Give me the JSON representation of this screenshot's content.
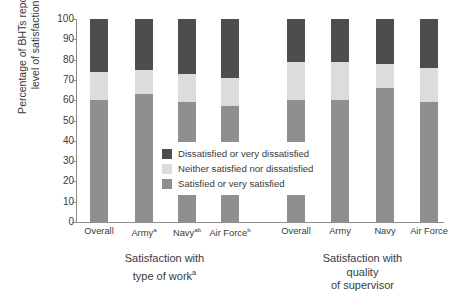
{
  "chart_data": {
    "type": "bar",
    "title": "",
    "subtitle": "",
    "stacked": true,
    "orientation": "vertical",
    "ylabel": "Percentage of BHTs reporting\nlevel of satisfaction",
    "xlabel": "",
    "ylim": [
      0,
      100
    ],
    "ytick_labels": [
      "0",
      "10",
      "20",
      "30",
      "40",
      "50",
      "60",
      "70",
      "80",
      "90",
      "100"
    ],
    "ytick_values": [
      0,
      10,
      20,
      30,
      40,
      50,
      60,
      70,
      80,
      90,
      100
    ],
    "grid": false,
    "legend_position": "center",
    "legend": [
      {
        "label": "Dissatisfied or very dissatisfied",
        "color": "#4d4d4d",
        "key": "dissatisfied"
      },
      {
        "label": "Neither satisfied nor dissatisfied",
        "color": "#dcdcdc",
        "key": "neutral"
      },
      {
        "label": "Satisfied or very satisfied",
        "color": "#8f8f8f",
        "key": "satisfied"
      }
    ],
    "series": [
      {
        "name": "Satisfied or very satisfied",
        "key": "satisfied",
        "color": "#8f8f8f"
      },
      {
        "name": "Neither satisfied nor dissatisfied",
        "key": "neutral",
        "color": "#dcdcdc"
      },
      {
        "name": "Dissatisfied or very dissatisfied",
        "key": "dissatisfied",
        "color": "#4d4d4d"
      }
    ],
    "groups": [
      {
        "title": "Satisfaction with\ntype of work",
        "title_sup": "a",
        "categories": [
          {
            "label": "Overall",
            "sup": "",
            "satisfied": 60,
            "neutral": 14,
            "dissatisfied": 26
          },
          {
            "label": "Army",
            "sup": "a",
            "satisfied": 63,
            "neutral": 12,
            "dissatisfied": 25
          },
          {
            "label": "Navy",
            "sup": "ab",
            "satisfied": 59,
            "neutral": 14,
            "dissatisfied": 27
          },
          {
            "label": "Air Force",
            "sup": "b",
            "satisfied": 57,
            "neutral": 14,
            "dissatisfied": 29
          }
        ]
      },
      {
        "title": "Satisfaction with quality\nof supervisor",
        "title_sup": "",
        "categories": [
          {
            "label": "Overall",
            "sup": "",
            "satisfied": 60,
            "neutral": 19,
            "dissatisfied": 21
          },
          {
            "label": "Army",
            "sup": "",
            "satisfied": 60,
            "neutral": 19,
            "dissatisfied": 21
          },
          {
            "label": "Navy",
            "sup": "",
            "satisfied": 66,
            "neutral": 12,
            "dissatisfied": 22
          },
          {
            "label": "Air Force",
            "sup": "",
            "satisfied": 59,
            "neutral": 17,
            "dissatisfied": 24
          }
        ]
      }
    ]
  }
}
